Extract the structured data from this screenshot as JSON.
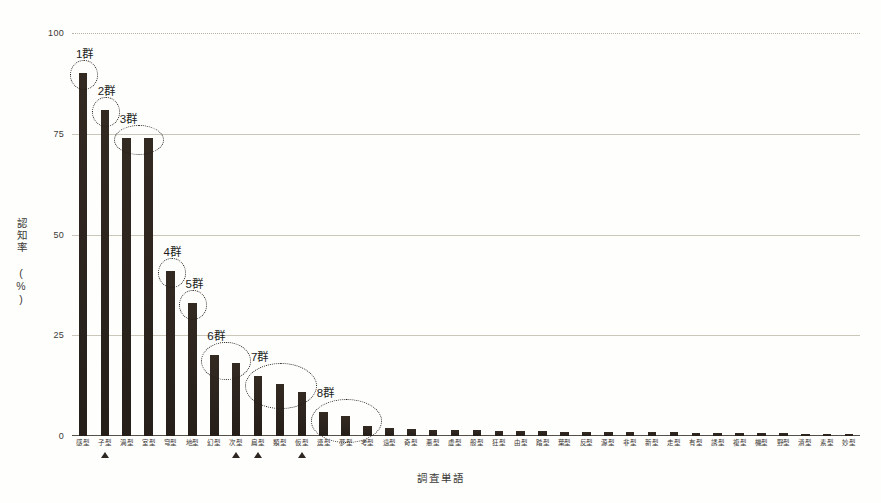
{
  "chart_data": {
    "type": "bar",
    "title": "",
    "xlabel": "調査単語",
    "ylabel": "認知率 (%)",
    "ylim": [
      0,
      100
    ],
    "yticks": [
      0,
      25,
      50,
      75,
      100
    ],
    "grid": true,
    "legend": "none",
    "categories": [
      "感型",
      "子型",
      "渦型",
      "室型",
      "穹型",
      "地型",
      "幻型",
      "次型",
      "扁型",
      "類型",
      "仮型",
      "連型",
      "夢型",
      "考型",
      "遠型",
      "奇型",
      "悪型",
      "虚型",
      "般型",
      "狂型",
      "由型",
      "踏型",
      "葉型",
      "反型",
      "源型",
      "非型",
      "新型",
      "走型",
      "有型",
      "誘型",
      "複型",
      "機型",
      "野型",
      "潰型",
      "素型",
      "妙型"
    ],
    "values": [
      90,
      81,
      74,
      74,
      41,
      33,
      20,
      18,
      15,
      13,
      11,
      6,
      5,
      2.5,
      2,
      1.8,
      1.6,
      1.5,
      1.4,
      1.3,
      1.2,
      1.2,
      1.1,
      1.0,
      1.0,
      1.0,
      0.9,
      0.9,
      0.8,
      0.8,
      0.8,
      0.7,
      0.7,
      0.6,
      0.6,
      0.5
    ],
    "annotations": [
      {
        "label": "1群",
        "bars": [
          0
        ]
      },
      {
        "label": "2群",
        "bars": [
          1
        ]
      },
      {
        "label": "3群",
        "bars": [
          2,
          3
        ]
      },
      {
        "label": "4群",
        "bars": [
          4
        ]
      },
      {
        "label": "5群",
        "bars": [
          5
        ]
      },
      {
        "label": "6群",
        "bars": [
          6,
          7
        ]
      },
      {
        "label": "7群",
        "bars": [
          8,
          9,
          10
        ]
      },
      {
        "label": "8群",
        "bars": [
          11,
          12,
          13
        ]
      }
    ],
    "markers": {
      "symbol": "triangle",
      "bars": [
        1,
        7,
        8,
        10
      ]
    }
  }
}
